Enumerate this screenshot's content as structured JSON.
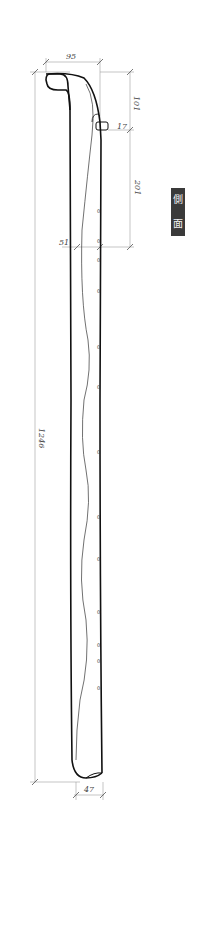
{
  "drawing": {
    "view_label_chars": [
      "側",
      "面"
    ],
    "dimensions": {
      "head_width": "95",
      "head_height": "101",
      "peg": "17",
      "upper_section": "201",
      "neck_width": "51",
      "total_length": "1246",
      "bottom_width": "47"
    },
    "colors": {
      "outline": "#111111",
      "dimension_line": "#9a9a9a",
      "label_bg": "#3a3a3a",
      "label_text": "#f2f2f2"
    },
    "finger_hole_marks": [
      "0",
      "0",
      "0",
      "0",
      "0",
      "0",
      "0",
      "0",
      "0",
      "0",
      "0",
      "0",
      "0",
      "0"
    ]
  }
}
